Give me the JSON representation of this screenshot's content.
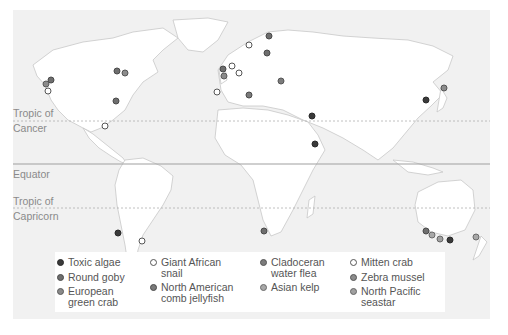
{
  "map": {
    "lines": {
      "tropic_cancer": {
        "label_line1": "Tropic of",
        "label_line2": "Cancer"
      },
      "equator": {
        "label": "Equator"
      },
      "tropic_capricorn": {
        "label_line1": "Tropic of",
        "label_line2": "Capricorn"
      }
    },
    "colors": {
      "background": "#f1f1f1",
      "land": "#ffffff",
      "borders": "#c8c8c8",
      "equator_line": "#a0a0a0",
      "tropic_line": "#b0b0b0"
    }
  },
  "species": {
    "toxic_algae": {
      "label": "Toxic algae",
      "fill": "#3a3a3a",
      "stroke": "#2a2a2a"
    },
    "round_goby": {
      "label": "Round goby",
      "fill": "#6e6e6e",
      "stroke": "#4a4a4a"
    },
    "european_green_crab": {
      "label": "European green crab",
      "line1": "European",
      "line2": "green crab",
      "fill": "#8a8a8a",
      "stroke": "#5a5a5a"
    },
    "giant_african_snail": {
      "label": "Giant African snail",
      "line1": "Giant African",
      "line2": "snail",
      "fill": "#ffffff",
      "stroke": "#555555"
    },
    "north_american_comb_jellyfish": {
      "label": "North American comb jellyfish",
      "line1": "North American",
      "line2": "comb jellyfish",
      "fill": "#7a7a7a",
      "stroke": "#4a4a4a"
    },
    "cladoceran_water_flea": {
      "label": "Cladoceran water flea",
      "line1": "Cladoceran",
      "line2": "water flea",
      "fill": "#7c7c7c",
      "stroke": "#555555"
    },
    "asian_kelp": {
      "label": "Asian kelp",
      "fill": "#a8a8a8",
      "stroke": "#6a6a6a"
    },
    "mitten_crab": {
      "label": "Mitten crab",
      "fill": "#ffffff",
      "stroke": "#555555"
    },
    "zebra_mussel": {
      "label": "Zebra mussel",
      "fill": "#8c8c8c",
      "stroke": "#555555"
    },
    "north_pacific_seastar": {
      "label": "North Pacific seastar",
      "line1": "North Pacific",
      "line2": "seastar",
      "fill": "#a0a0a0",
      "stroke": "#666666"
    }
  },
  "markers": [
    {
      "species": "round_goby",
      "x": 51,
      "y": 80
    },
    {
      "species": "european_green_crab",
      "x": 46,
      "y": 84
    },
    {
      "species": "mitten_crab",
      "x": 48,
      "y": 91
    },
    {
      "species": "round_goby",
      "x": 117,
      "y": 71
    },
    {
      "species": "zebra_mussel",
      "x": 125,
      "y": 73
    },
    {
      "species": "round_goby",
      "x": 116,
      "y": 101
    },
    {
      "species": "giant_african_snail",
      "x": 105,
      "y": 126
    },
    {
      "species": "mitten_crab",
      "x": 249,
      "y": 45
    },
    {
      "species": "round_goby",
      "x": 223,
      "y": 69
    },
    {
      "species": "european_green_crab",
      "x": 224,
      "y": 76
    },
    {
      "species": "mitten_crab",
      "x": 232,
      "y": 66
    },
    {
      "species": "mitten_crab",
      "x": 239,
      "y": 73
    },
    {
      "species": "mitten_crab",
      "x": 217,
      "y": 92
    },
    {
      "species": "north_american_comb_jellyfish",
      "x": 249,
      "y": 95
    },
    {
      "species": "round_goby",
      "x": 269,
      "y": 36
    },
    {
      "species": "round_goby",
      "x": 267,
      "y": 53
    },
    {
      "species": "cladoceran_water_flea",
      "x": 281,
      "y": 81
    },
    {
      "species": "toxic_algae",
      "x": 312,
      "y": 116
    },
    {
      "species": "toxic_algae",
      "x": 315,
      "y": 144
    },
    {
      "species": "toxic_algae",
      "x": 426,
      "y": 100
    },
    {
      "species": "zebra_mussel",
      "x": 444,
      "y": 88
    },
    {
      "species": "toxic_algae",
      "x": 118,
      "y": 233
    },
    {
      "species": "giant_african_snail",
      "x": 142,
      "y": 241
    },
    {
      "species": "round_goby",
      "x": 264,
      "y": 231
    },
    {
      "species": "round_goby",
      "x": 426,
      "y": 231
    },
    {
      "species": "asian_kelp",
      "x": 432,
      "y": 235
    },
    {
      "species": "north_pacific_seastar",
      "x": 440,
      "y": 239
    },
    {
      "species": "toxic_algae",
      "x": 450,
      "y": 240
    },
    {
      "species": "asian_kelp",
      "x": 476,
      "y": 237
    }
  ],
  "legend": {
    "columns": [
      [
        "toxic_algae",
        "round_goby",
        "european_green_crab"
      ],
      [
        "giant_african_snail",
        "north_american_comb_jellyfish"
      ],
      [
        "cladoceran_water_flea",
        "asian_kelp"
      ],
      [
        "mitten_crab",
        "zebra_mussel",
        "north_pacific_seastar"
      ]
    ]
  }
}
